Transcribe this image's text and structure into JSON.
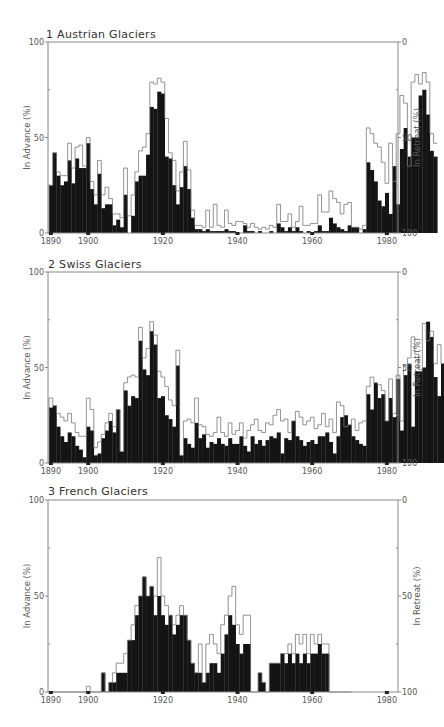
{
  "chart_data": [
    {
      "type": "bar",
      "title": "1  Austrian Glaciers",
      "xlabel": "",
      "ylabel": "In Advance (%)",
      "y2label": "In Retreat (%)",
      "ylim": [
        0,
        100
      ],
      "y2lim": [
        100,
        0
      ],
      "yticks": [
        "0",
        "50",
        "100"
      ],
      "y2ticks": [
        "100",
        "50",
        "0"
      ],
      "xticks": [
        "1890",
        "1900",
        "1920",
        "1940",
        "1960",
        "1980"
      ],
      "grid": false,
      "legend": null,
      "x_start": 1890,
      "series": [
        {
          "name": "Advancing (black)",
          "values": [
            25,
            42,
            30,
            25,
            27,
            38,
            26,
            39,
            34,
            34,
            47,
            23,
            15,
            31,
            13,
            15,
            15,
            4,
            7,
            3,
            20,
            0,
            9,
            27,
            30,
            30,
            41,
            66,
            65,
            74,
            73,
            40,
            39,
            25,
            15,
            24,
            35,
            23,
            8,
            2,
            2,
            1,
            2,
            1,
            1,
            1,
            1,
            2,
            1,
            1,
            0,
            0,
            4,
            1,
            1,
            0,
            1,
            0,
            0,
            1,
            0,
            5,
            3,
            1,
            3,
            1,
            3,
            1,
            0,
            1,
            0,
            1,
            4,
            1,
            1,
            8,
            5,
            3,
            2,
            1,
            4,
            3,
            3,
            0,
            2,
            37,
            33,
            27,
            17,
            14,
            21,
            10,
            35,
            15,
            44,
            55,
            40,
            50,
            50,
            72,
            75,
            62,
            43,
            40
          ]
        },
        {
          "name": "Advancing + Stationary (outline)",
          "values": [
            25,
            42,
            32,
            30,
            30,
            47,
            34,
            45,
            46,
            35,
            50,
            27,
            20,
            38,
            20,
            24,
            18,
            10,
            10,
            8,
            34,
            9,
            20,
            32,
            43,
            45,
            52,
            79,
            78,
            81,
            79,
            60,
            42,
            38,
            22,
            32,
            48,
            33,
            12,
            4,
            4,
            3,
            12,
            3,
            15,
            4,
            3,
            12,
            5,
            4,
            6,
            6,
            5,
            3,
            5,
            3,
            2,
            3,
            2,
            4,
            3,
            15,
            6,
            6,
            10,
            3,
            6,
            14,
            4,
            4,
            5,
            5,
            20,
            11,
            11,
            22,
            18,
            16,
            10,
            15,
            16,
            3,
            3,
            2,
            4,
            55,
            52,
            47,
            45,
            37,
            26,
            47,
            27,
            52,
            72,
            68,
            35,
            79,
            83,
            78,
            84,
            79,
            52,
            47
          ]
        }
      ]
    },
    {
      "type": "bar",
      "title": "2  Swiss Glaciers",
      "xlabel": "",
      "ylabel": "In Advance (%)",
      "y2label": "In Retreat (%)",
      "ylim": [
        0,
        100
      ],
      "y2lim": [
        100,
        0
      ],
      "yticks": [
        "0",
        "50",
        "100"
      ],
      "y2ticks": [
        "100",
        "50",
        "0"
      ],
      "xticks": [
        "1890",
        "1900",
        "1920",
        "1940",
        "1960",
        "1980"
      ],
      "grid": false,
      "legend": null,
      "x_start": 1890,
      "series": [
        {
          "name": "Advancing (black)",
          "values": [
            29,
            30,
            19,
            14,
            11,
            16,
            14,
            9,
            7,
            3,
            19,
            17,
            4,
            5,
            13,
            17,
            22,
            16,
            28,
            6,
            38,
            30,
            35,
            34,
            64,
            49,
            46,
            69,
            62,
            34,
            35,
            25,
            23,
            19,
            51,
            4,
            13,
            10,
            8,
            21,
            13,
            15,
            8,
            11,
            10,
            13,
            10,
            9,
            13,
            10,
            10,
            14,
            9,
            6,
            14,
            10,
            12,
            9,
            12,
            14,
            13,
            16,
            5,
            13,
            12,
            22,
            14,
            12,
            9,
            11,
            12,
            10,
            14,
            14,
            16,
            11,
            5,
            14,
            24,
            25,
            20,
            14,
            12,
            10,
            9,
            36,
            28,
            42,
            34,
            36,
            22,
            34,
            24,
            44,
            17,
            46,
            52,
            19,
            48,
            48,
            50,
            74,
            66,
            45,
            35,
            52,
            41,
            43
          ]
        },
        {
          "name": "Advancing + Stationary (outline)",
          "values": [
            34,
            30,
            26,
            24,
            22,
            26,
            21,
            16,
            14,
            14,
            34,
            28,
            8,
            11,
            15,
            21,
            26,
            19,
            28,
            6,
            42,
            45,
            46,
            45,
            71,
            55,
            60,
            74,
            67,
            48,
            45,
            40,
            33,
            30,
            59,
            4,
            22,
            23,
            21,
            34,
            20,
            19,
            15,
            14,
            16,
            24,
            16,
            14,
            21,
            15,
            17,
            21,
            13,
            17,
            20,
            23,
            17,
            16,
            21,
            20,
            25,
            28,
            22,
            23,
            16,
            22,
            27,
            24,
            20,
            22,
            24,
            18,
            20,
            26,
            19,
            23,
            16,
            32,
            30,
            19,
            20,
            23,
            17,
            21,
            22,
            40,
            45,
            42,
            41,
            38,
            22,
            44,
            26,
            46,
            22,
            51,
            55,
            66,
            57,
            49,
            73,
            64,
            69,
            52,
            62,
            52,
            45,
            48
          ]
        }
      ]
    },
    {
      "type": "bar",
      "title": "3  French Glaciers",
      "xlabel": "",
      "ylabel": "In Advance (%)",
      "y2label": "In Retreat (%)",
      "ylim": [
        0,
        100
      ],
      "y2lim": [
        100,
        0
      ],
      "yticks": [
        "0",
        "50",
        "100"
      ],
      "y2ticks": [
        "100",
        "50",
        "0"
      ],
      "xticks": [
        "1890",
        "1900",
        "1920",
        "1940",
        "1960",
        "1980"
      ],
      "grid": false,
      "legend": null,
      "x_start": 1890,
      "series": [
        {
          "name": "Advancing (black)",
          "values": [
            0,
            0,
            0,
            0,
            0,
            0,
            0,
            0,
            0,
            0,
            0,
            0,
            0,
            0,
            10,
            0,
            5,
            5,
            10,
            10,
            10,
            27,
            27,
            40,
            50,
            60,
            50,
            55,
            40,
            50,
            40,
            35,
            40,
            30,
            35,
            40,
            40,
            27,
            15,
            10,
            10,
            5,
            10,
            15,
            15,
            10,
            20,
            30,
            40,
            35,
            25,
            20,
            25,
            25,
            0,
            0,
            10,
            5,
            0,
            15,
            15,
            15,
            20,
            15,
            20,
            15,
            20,
            15,
            20,
            15,
            20,
            20,
            25,
            20,
            20,
            0,
            0,
            0,
            0,
            0,
            0
          ]
        },
        {
          "name": "Advancing + Stationary (outline)",
          "values": [
            0,
            0,
            0,
            0,
            0,
            0,
            0,
            0,
            0,
            0,
            3,
            0,
            0,
            0,
            10,
            0,
            5,
            10,
            15,
            15,
            20,
            27,
            35,
            45,
            50,
            60,
            50,
            55,
            50,
            70,
            50,
            45,
            40,
            35,
            40,
            45,
            40,
            27,
            15,
            10,
            25,
            5,
            25,
            30,
            25,
            20,
            35,
            40,
            50,
            55,
            35,
            30,
            40,
            40,
            0,
            0,
            10,
            5,
            0,
            15,
            15,
            15,
            20,
            20,
            25,
            20,
            30,
            25,
            30,
            20,
            30,
            25,
            30,
            25,
            25,
            0,
            0,
            0,
            0,
            0,
            0
          ]
        }
      ]
    }
  ],
  "panels": [
    {
      "title": "1   Austrian Glaciers"
    },
    {
      "title": "2  Swiss Glaciers"
    },
    {
      "title": "3  French Glaciers"
    }
  ],
  "axes": {
    "left_label": "In Advance (%)",
    "right_label": "In Retreat (%)",
    "left_ticks": [
      "100",
      "50",
      "0"
    ],
    "right_ticks": [
      "0",
      "50",
      "100"
    ],
    "x_ticks": [
      "1890",
      "1900",
      "1920",
      "1940",
      "1960",
      "1980"
    ]
  }
}
